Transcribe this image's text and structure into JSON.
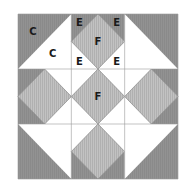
{
  "diagram": {
    "colors": {
      "dark": "#8f8f8f",
      "light": "#bdbdbd",
      "white": "#ffffff",
      "line": "#9a9a9a",
      "outline": "#7a7a7a"
    },
    "grid": {
      "rows": 3,
      "cols": 3
    },
    "cells": [
      {
        "row": 0,
        "col": 0,
        "type": "half-square",
        "dark_half": "top-left"
      },
      {
        "row": 0,
        "col": 1,
        "type": "square-in-square",
        "dark_corners": [
          "top-left",
          "top-right"
        ]
      },
      {
        "row": 0,
        "col": 2,
        "type": "half-square",
        "dark_half": "top-right"
      },
      {
        "row": 1,
        "col": 0,
        "type": "square-in-square",
        "dark_corners": [
          "top-left",
          "bottom-left"
        ]
      },
      {
        "row": 1,
        "col": 1,
        "type": "square-in-square",
        "dark_corners": []
      },
      {
        "row": 1,
        "col": 2,
        "type": "square-in-square",
        "dark_corners": [
          "top-right",
          "bottom-right"
        ]
      },
      {
        "row": 2,
        "col": 0,
        "type": "half-square",
        "dark_half": "bottom-left"
      },
      {
        "row": 2,
        "col": 1,
        "type": "square-in-square",
        "dark_corners": [
          "bottom-left",
          "bottom-right"
        ]
      },
      {
        "row": 2,
        "col": 2,
        "type": "half-square",
        "dark_half": "bottom-right"
      }
    ],
    "labels": [
      {
        "text": "C",
        "cell": [
          0,
          0
        ],
        "pos": "dark-half"
      },
      {
        "text": "C",
        "cell": [
          0,
          0
        ],
        "pos": "light-half"
      },
      {
        "text": "E",
        "cell": [
          0,
          1
        ],
        "pos": "top-left"
      },
      {
        "text": "E",
        "cell": [
          0,
          1
        ],
        "pos": "top-right"
      },
      {
        "text": "E",
        "cell": [
          0,
          1
        ],
        "pos": "bottom-left"
      },
      {
        "text": "E",
        "cell": [
          0,
          1
        ],
        "pos": "bottom-right"
      },
      {
        "text": "F",
        "cell": [
          0,
          1
        ],
        "pos": "center"
      },
      {
        "text": "F",
        "cell": [
          1,
          1
        ],
        "pos": "center"
      }
    ]
  }
}
